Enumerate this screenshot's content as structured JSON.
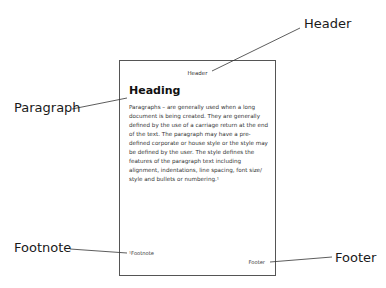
{
  "callouts": {
    "header": "Header",
    "paragraph": "Paragraph",
    "footnote": "Footnote",
    "footer": "Footer"
  },
  "page": {
    "header": "Header",
    "heading": "Heading",
    "paragraph": "Paragraphs – are generally used when a long document is being created. They are generally defined by the use of a carriage return at the end of the text. The paragraph may have a pre-defined corporate or house style or the style may be defined by the user. The style defines the features of the paragraph text including alignment, indentations, line spacing, font size/ style and bullets or numbering.¹",
    "footnote": "¹Footnote",
    "footer": "Footer"
  }
}
